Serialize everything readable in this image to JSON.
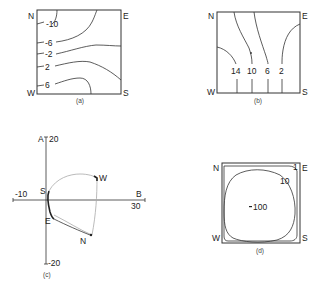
{
  "panels": {
    "a": {
      "caption": "(a)",
      "corners": {
        "nw": "N",
        "ne": "E",
        "sw": "W",
        "se": "S"
      },
      "contour_labels": [
        "-10",
        "-6",
        "-2",
        "2",
        "6"
      ]
    },
    "b": {
      "caption": "(b)",
      "corners": {
        "nw": "N",
        "ne": "E",
        "sw": "W",
        "se": "S"
      },
      "contour_labels": [
        "14",
        "10",
        "6",
        "2"
      ]
    },
    "c": {
      "caption": "(c)",
      "axis_y_label": "A",
      "axis_y_max": "20",
      "axis_y_min": "-20",
      "axis_x_label": "B",
      "axis_x_max": "30",
      "axis_x_min": "-10",
      "point_labels": {
        "s": "S",
        "w": "W",
        "e": "E",
        "n": "N"
      }
    },
    "d": {
      "caption": "(d)",
      "corners": {
        "nw": "N",
        "ne": "E",
        "sw": "W",
        "se": "S"
      },
      "contour_labels": [
        "1",
        "10"
      ],
      "center_label": "100"
    }
  }
}
